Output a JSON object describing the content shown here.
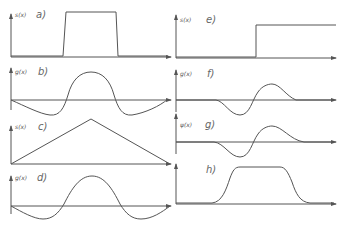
{
  "panels": [
    {
      "id": "a",
      "label": "a)",
      "ylabel": "s(x)",
      "type": "rectangular pulse"
    },
    {
      "id": "b",
      "label": "b)",
      "ylabel": "g(x)",
      "type": "sinc-like response"
    },
    {
      "id": "c",
      "label": "c)",
      "ylabel": "s(x)",
      "type": "triangle"
    },
    {
      "id": "d",
      "label": "d)",
      "ylabel": "g(x)",
      "type": "sinc-like response"
    },
    {
      "id": "e",
      "label": "e)",
      "ylabel": "s(x)",
      "type": "step"
    },
    {
      "id": "f",
      "label": "f)",
      "ylabel": "g(x)",
      "type": "wavelet"
    },
    {
      "id": "g",
      "label": "g)",
      "ylabel": "ψ(x)",
      "type": "wavelet"
    },
    {
      "id": "h",
      "label": "h)",
      "ylabel": "",
      "type": "smoothed pulse"
    }
  ],
  "colors": {
    "stroke": "#555555",
    "background": "#ffffff"
  }
}
